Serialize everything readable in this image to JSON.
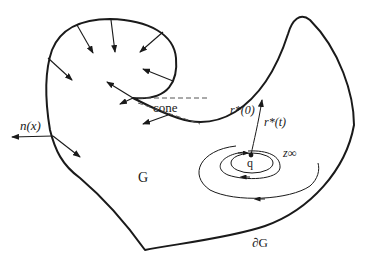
{
  "diagram": {
    "type": "domain boundary sketch",
    "labels": {
      "region": "G",
      "boundary": "∂G",
      "normal": "n(x)",
      "cone": "cone",
      "r0": "r*(0)",
      "rt": "r*(t)",
      "point": "q",
      "limit": "z∞"
    },
    "colors": {
      "stroke": "#1a1a1a",
      "dash": "#555555",
      "background": "#ffffff"
    }
  }
}
